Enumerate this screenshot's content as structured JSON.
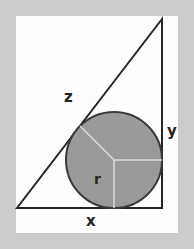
{
  "figure": {
    "canvas": {
      "width": 194,
      "height": 249
    },
    "matte": {
      "color": "#cccccc",
      "inset": 16
    },
    "panel": {
      "color": "#fdfdfd",
      "x": 16,
      "y": 16,
      "width": 162,
      "height": 217
    }
  },
  "labels": {
    "hypotenuse": "z",
    "vertical_leg": "y",
    "horizontal_leg": "x",
    "radius": "r"
  },
  "colors": {
    "stroke": "#262626",
    "circle_fill": "#9a9a9a",
    "circle_stroke": "#3a3a3a",
    "radius_line": "#d8d8d8",
    "matte": "#cccccc",
    "panel": "#fdfdfd"
  },
  "geometry": {
    "triangle": {
      "apex": [
        162,
        19
      ],
      "bottom_left": [
        17,
        208
      ],
      "bottom_right": [
        162,
        208
      ]
    },
    "circle": {
      "center": [
        114,
        160
      ],
      "radius": 48
    },
    "radius_lines": [
      {
        "name": "to-hypotenuse",
        "to": [
          80,
          126
        ]
      },
      {
        "name": "to-vertical-leg",
        "to": [
          162,
          160
        ]
      },
      {
        "name": "to-base",
        "to": [
          114,
          208
        ]
      }
    ],
    "stroke_width": 2
  }
}
